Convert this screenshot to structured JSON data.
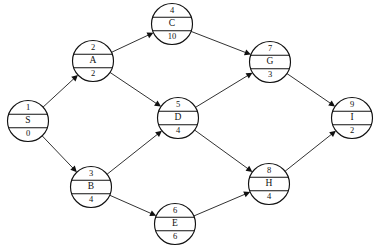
{
  "diagram": {
    "type": "node-link-diagram",
    "background_color": "#ffffff",
    "line_color": "#1a1a1a",
    "node_fill": "#ffffff",
    "node_stroke": "#111111",
    "node_radius": 20.5,
    "arrow_style": "filled-triangle",
    "nodes": [
      {
        "id": "S",
        "index": "1",
        "label": "S",
        "weight": "0",
        "cx": 28,
        "cy": 121
      },
      {
        "id": "A",
        "index": "2",
        "label": "A",
        "weight": "2",
        "cx": 93,
        "cy": 61
      },
      {
        "id": "B",
        "index": "3",
        "label": "B",
        "weight": "4",
        "cx": 91,
        "cy": 187
      },
      {
        "id": "C",
        "index": "4",
        "label": "C",
        "weight": "10",
        "cx": 172,
        "cy": 24
      },
      {
        "id": "D",
        "index": "5",
        "label": "D",
        "weight": "4",
        "cx": 178,
        "cy": 118
      },
      {
        "id": "E",
        "index": "6",
        "label": "E",
        "weight": "6",
        "cx": 175,
        "cy": 224
      },
      {
        "id": "G",
        "index": "7",
        "label": "G",
        "weight": "3",
        "cx": 270,
        "cy": 62
      },
      {
        "id": "H",
        "index": "8",
        "label": "H",
        "weight": "4",
        "cx": 269,
        "cy": 184
      },
      {
        "id": "I",
        "index": "9",
        "label": "I",
        "weight": "2",
        "cx": 352,
        "cy": 118
      }
    ],
    "edges": [
      {
        "from": "S",
        "to": "A",
        "directed": true
      },
      {
        "from": "S",
        "to": "B",
        "directed": true
      },
      {
        "from": "A",
        "to": "C",
        "directed": true
      },
      {
        "from": "A",
        "to": "D",
        "directed": true
      },
      {
        "from": "B",
        "to": "D",
        "directed": true
      },
      {
        "from": "B",
        "to": "E",
        "directed": true
      },
      {
        "from": "C",
        "to": "G",
        "directed": true
      },
      {
        "from": "D",
        "to": "G",
        "directed": true
      },
      {
        "from": "D",
        "to": "H",
        "directed": true
      },
      {
        "from": "E",
        "to": "H",
        "directed": true
      },
      {
        "from": "G",
        "to": "I",
        "directed": true
      },
      {
        "from": "H",
        "to": "I",
        "directed": true
      }
    ]
  }
}
